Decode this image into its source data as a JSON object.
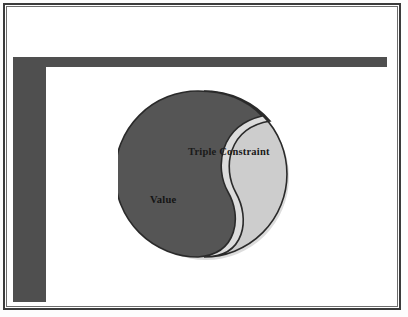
{
  "slide": {
    "background_color": "#fdfdfd",
    "frame": {
      "outer_border_color": "#3b3b3b",
      "inner_border_color": "#6d6d6d",
      "canvas_color": "#ffffff"
    },
    "accent_bars": {
      "color": "#4f4f4f",
      "shape": "l-shape",
      "horizontal_label": "top-accent-bar",
      "vertical_label": "left-accent-bar"
    }
  },
  "diagram": {
    "name": "yin-yang-balance",
    "type": "two-part-balance",
    "dark_half": {
      "label": "Value",
      "fill_color": "#555555",
      "outline_color": "#2a2a2a"
    },
    "light_half": {
      "label": "Triple Constraint",
      "fill_color": "#cdcdcd",
      "outline_color": "#2a2a2a"
    },
    "separator_color": "#ffffff"
  },
  "labels": {
    "triple_constraint": "Triple Constraint",
    "value": "Value"
  }
}
